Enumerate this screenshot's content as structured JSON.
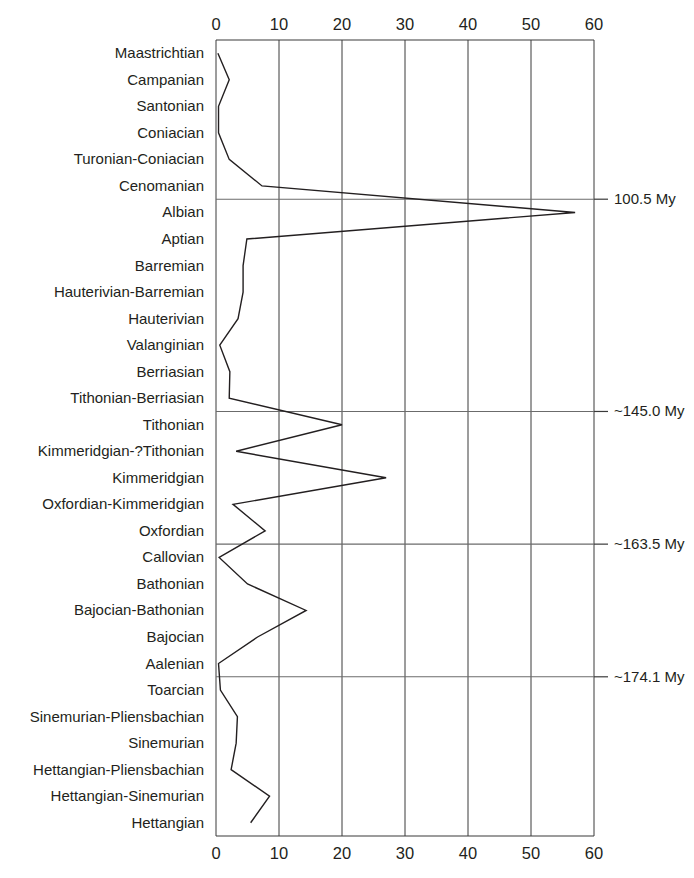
{
  "chart_data": {
    "type": "line",
    "title": "",
    "subtitle": "",
    "xlabel": "",
    "ylabel": "",
    "orientation": "horizontal-categories-on-y",
    "grid": true,
    "legend": null,
    "legend_position": "none",
    "xlim": [
      0,
      60
    ],
    "xticks": [
      0,
      10,
      20,
      30,
      40,
      50,
      60
    ],
    "xtick_labels": [
      "0",
      "10",
      "20",
      "30",
      "40",
      "50",
      "60"
    ],
    "x_axis_top": true,
    "x_axis_bottom": true,
    "categories": [
      "Maastrichtian",
      "Campanian",
      "Santonian",
      "Coniacian",
      "Turonian-Coniacian",
      "Cenomanian",
      "Albian",
      "Aptian",
      "Barremian",
      "Hauterivian-Barremian",
      "Hauterivian",
      "Valanginian",
      "Berriasian",
      "Tithonian-Berriasian",
      "Tithonian",
      "Kimmeridgian-?Tithonian",
      "Kimmeridgian",
      "Oxfordian-Kimmeridgian",
      "Oxfordian",
      "Callovian",
      "Bathonian",
      "Bajocian-Bathonian",
      "Bajocian",
      "Aalenian",
      "Toarcian",
      "Sinemurian-Pliensbachian",
      "Sinemurian",
      "Hettangian-Pliensbachian",
      "Hettangian-Sinemurian",
      "Hettangian"
    ],
    "values": [
      0.3,
      2.1,
      0.4,
      0.4,
      2.1,
      7.3,
      57.0,
      4.9,
      4.3,
      4.3,
      3.5,
      0.6,
      2.2,
      2.1,
      20.0,
      3.2,
      27.0,
      2.7,
      7.8,
      0.5,
      5.0,
      14.3,
      6.6,
      0.4,
      0.7,
      3.4,
      3.2,
      2.4,
      8.5,
      5.5
    ],
    "annotations": [
      {
        "label": "100.5 My",
        "at_category": "Cenomanian-Albian boundary",
        "index_after": 5
      },
      {
        "label": "~145.0 My",
        "at_category": "Tithonian-Berriasian boundary",
        "index_after": 13
      },
      {
        "label": "~163.5 My",
        "at_category": "Oxfordian-Callovian boundary",
        "index_after": 18
      },
      {
        "label": "~174.1 My",
        "at_category": "Aalenian-Toarcian boundary",
        "index_after": 23
      }
    ],
    "colors": {
      "line": "#231f20",
      "grid": "#3a3a3a",
      "frame": "#3a3a3a",
      "annotation_rule": "#6b6b6b",
      "text": "#231f20",
      "background": "#ffffff"
    }
  }
}
